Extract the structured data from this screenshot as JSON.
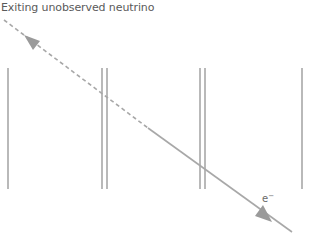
{
  "labels": {
    "neutrino": "Exiting unobserved neutrino",
    "electron_base": "e",
    "electron_sup": "−"
  },
  "colors": {
    "track": "#a8a8a8",
    "detector": "#8a8a8a",
    "text": "#5a5a5a"
  },
  "detector_planes": [
    {
      "type": "single",
      "x": [
        8
      ]
    },
    {
      "type": "double",
      "x": [
        102,
        107
      ]
    },
    {
      "type": "double",
      "x": [
        200,
        205
      ]
    },
    {
      "type": "single",
      "x": [
        302
      ]
    }
  ],
  "track": {
    "start": [
      4,
      20
    ],
    "dash_end": [
      148,
      128
    ],
    "end": [
      292,
      232
    ],
    "arrows": [
      "up-left on dashed neutrino segment",
      "down-right on solid electron segment"
    ]
  }
}
